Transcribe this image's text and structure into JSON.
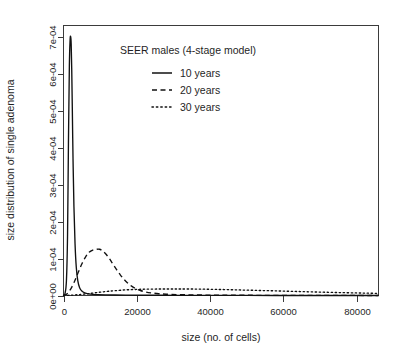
{
  "chart_data": {
    "type": "line",
    "title": "SEER males (4-stage model)",
    "xlabel": "size (no. of cells)",
    "ylabel": "size distribution of single adenoma",
    "xlim": [
      0,
      86000
    ],
    "ylim": [
      0,
      0.00073
    ],
    "grid": false,
    "legend_position": "top-center-inside",
    "xticks": [
      0,
      20000,
      40000,
      60000,
      80000
    ],
    "xtick_labels": [
      "0",
      "20000",
      "40000",
      "60000",
      "80000"
    ],
    "yticks": [
      0,
      0.0001,
      0.0002,
      0.0003,
      0.0004,
      0.0005,
      0.0006,
      0.0007
    ],
    "ytick_labels": [
      "0e+00",
      "1e-04",
      "2e-04",
      "3e-04",
      "4e-04",
      "5e-04",
      "6e-04",
      "7e-04"
    ],
    "series": [
      {
        "name": "10 years",
        "style": "solid",
        "peak_x": 2100,
        "peak_y": 0.0007,
        "x": [
          0,
          400,
          800,
          1100,
          1350,
          1600,
          1800,
          1950,
          2100,
          2250,
          2400,
          2600,
          2850,
          3150,
          3500,
          3900,
          4400,
          5000,
          5800,
          6800,
          8000,
          9500,
          11500,
          14000,
          17000,
          21000,
          26000,
          32000,
          40000,
          50000,
          62000,
          74000,
          86000
        ],
        "y": [
          0.0,
          5e-06,
          4e-05,
          0.00016,
          0.00041,
          0.00062,
          0.00069,
          0.0007,
          0.00068,
          0.00061,
          0.00051,
          0.00037,
          0.00024,
          0.00014,
          7.5e-05,
          4e-05,
          2.1e-05,
          1.2e-05,
          7e-06,
          4.5e-06,
          3.2e-06,
          2.4e-06,
          1.8e-06,
          1.4e-06,
          1.1e-06,
          8e-07,
          6e-07,
          4e-07,
          3e-07,
          2e-07,
          1e-07,
          1e-07,
          0.0
        ]
      },
      {
        "name": "20 years",
        "style": "dashed",
        "peak_x": 9800,
        "peak_y": 0.000125,
        "x": [
          0,
          1000,
          2000,
          3000,
          4000,
          5000,
          6000,
          7000,
          8000,
          9000,
          9800,
          10600,
          11500,
          12500,
          13500,
          14500,
          15500,
          16500,
          17500,
          18500,
          19500,
          21000,
          22500,
          24000,
          26000,
          28000,
          31000,
          35000,
          40000,
          46000,
          54000,
          64000,
          74000,
          86000
        ],
        "y": [
          0.0,
          5e-06,
          1.8e-05,
          3.8e-05,
          6.2e-05,
          8.5e-05,
          0.000104,
          0.000117,
          0.000123,
          0.000125,
          0.000125,
          0.000121,
          0.000113,
          0.0001,
          8.5e-05,
          7e-05,
          5.6e-05,
          4.4e-05,
          3.4e-05,
          2.6e-05,
          2e-05,
          1.35e-05,
          9.5e-06,
          7e-06,
          4.8e-06,
          3.5e-06,
          2.4e-06,
          1.6e-06,
          1.1e-06,
          8e-07,
          5e-07,
          3e-07,
          2e-07,
          1e-07
        ]
      },
      {
        "name": "30 years",
        "style": "dotted",
        "peak_x": 36000,
        "peak_y": 1.75e-05,
        "x": [
          0,
          2000,
          4000,
          6000,
          8000,
          10000,
          12000,
          14000,
          17000,
          20000,
          23000,
          26000,
          29000,
          32000,
          36000,
          40000,
          44000,
          48000,
          52000,
          56000,
          60000,
          64000,
          68000,
          72000,
          76000,
          80000,
          83000,
          86000
        ],
        "y": [
          0.0,
          8e-07,
          2.2e-06,
          4.2e-06,
          6.5e-06,
          9e-06,
          1.12e-05,
          1.3e-05,
          1.52e-05,
          1.65e-05,
          1.72e-05,
          1.75e-05,
          1.76e-05,
          1.76e-05,
          1.74e-05,
          1.68e-05,
          1.6e-05,
          1.5e-05,
          1.4e-05,
          1.3e-05,
          1.19e-05,
          1.08e-05,
          9.7e-06,
          8.7e-06,
          7.8e-06,
          6.9e-06,
          6.3e-06,
          5.7e-06
        ]
      }
    ]
  }
}
